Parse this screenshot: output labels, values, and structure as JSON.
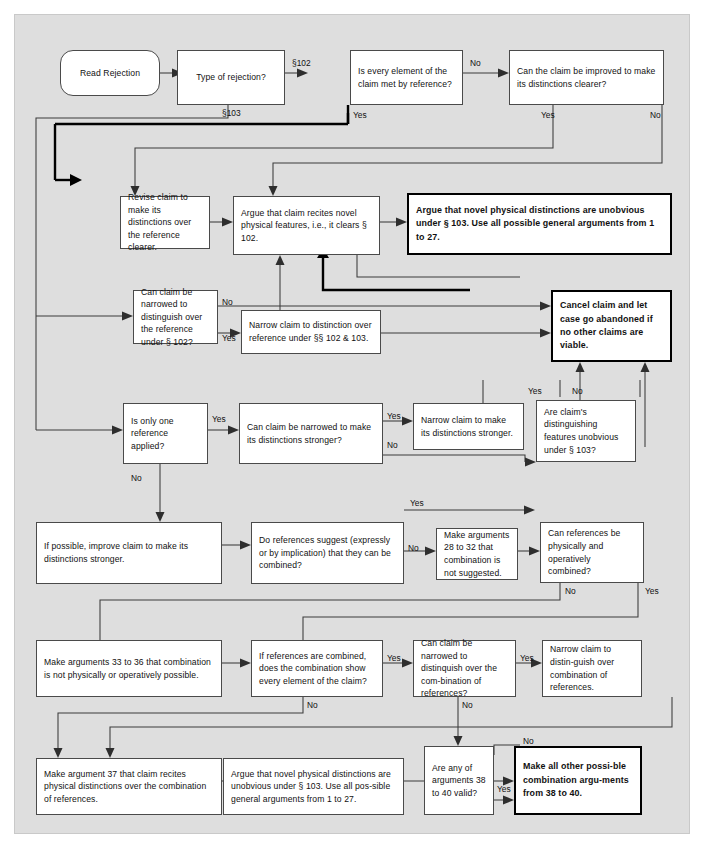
{
  "diagram": {
    "background_color": "#dedede",
    "accent_color": "#000000"
  },
  "nodes": {
    "read_rejection": "Read Rejection",
    "type_of_rejection": "Type of rejection?",
    "every_element_met": "Is every element of the claim met by reference?",
    "claim_improved_clearer": "Can the claim be improved to make its distinctions clearer?",
    "revise_claim": "Revise claim to make its distinctions over the reference clearer.",
    "argue_recites_novel": "Argue that claim recites novel physical features, i.e., it clears § 102.",
    "argue_novel_unobvious_103": "Argue that novel physical distinctions are unobvious under § 103. Use all possible general arguments from 1 to 27.",
    "narrowed_distinguish_102": "Can claim be narrowed to distinguish over the reference under § 102?",
    "narrow_to_distinction_102_103": "Narrow claim to distinction over reference under §§ 102 & 103.",
    "cancel_claim": "Cancel claim and let case go abandoned if no other claims are viable.",
    "only_one_reference": "Is only one reference applied?",
    "narrowed_stronger": "Can claim be narrowed to make its distinctions stronger?",
    "narrow_make_stronger": "Narrow claim to  make its distinctions stronger.",
    "distinguishing_unobvious_103": "Are claim's distinguishing features unobvious under § 103?",
    "if_possible_improve": "If possible, improve  claim to make its distinctions stronger.",
    "do_refs_suggest": "Do references suggest  (expressly or by implication) that they can be combined?",
    "make_args_28_32": "Make arguments  28 to 32 that combination is not suggested.",
    "refs_physically_combined": "Can references be physically and operatively combined?",
    "make_args_33_36": "Make arguments 33 to 36 that combination is not physically or operatively possible.",
    "if_refs_combined_show": "If references are combined, does the combination show every element of the claim?",
    "narrowed_over_combination": "Can claim be narrowed to distinquish over the com-bination of references?",
    "narrow_distinguish_combination": "Narrow claim to distin-guish over combination of references.",
    "make_arg_37": "Make argument 37 that claim recites physical distinctions over the combination of references.",
    "argue_novel_unobvious_bottom": "Argue that novel physical distinctions are unobvious under § 103. Use all pos-sible general arguments from 1 to 27.",
    "args_38_40_valid": "Are any of arguments 38 to 40 valid?",
    "make_all_other_combination": "Make all other  possi-ble combination argu-ments from 38 to 40."
  },
  "edge_labels": {
    "s102": "§102",
    "s103": "§103",
    "no_1": "No",
    "yes_1": "Yes",
    "yes_2": "Yes",
    "no_2": "No",
    "no_3": "No",
    "yes_3": "Yes",
    "yes_4": "Yes",
    "yes_5": "Yes",
    "no_4": "No",
    "yes_6": "Yes",
    "no_5": "No",
    "no_6": "No",
    "yes_7": "Yes",
    "no_7": "No",
    "no_8": "No",
    "yes_8": "Yes",
    "no_9": "No",
    "yes_9": "Yes",
    "no_10": "No",
    "yes_10": "Yes",
    "no_11": "No",
    "no_12": "No",
    "yes_11": "Yes"
  }
}
